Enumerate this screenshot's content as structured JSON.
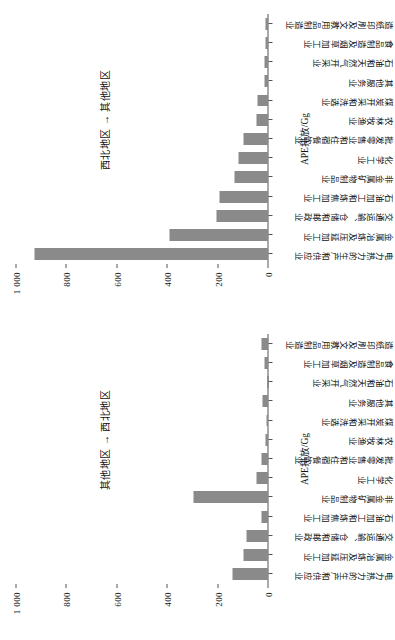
{
  "chart_data": [
    {
      "type": "bar",
      "panel_id": "right-panel",
      "title": "其他地区 → 西北地区",
      "xlabel": "",
      "ylabel": "APE排放/Gg",
      "ylim": [
        0,
        1000
      ],
      "yticks": [
        0,
        200,
        400,
        600,
        800,
        1000
      ],
      "ytick_labels": [
        "0",
        "200",
        "400",
        "600",
        "800",
        "1 000"
      ],
      "grid": false,
      "legend": "none",
      "orientation": "vertical-bars",
      "bar_color": "#8a8a8a",
      "categories": [
        "电力热力的生产和供应业",
        "金属冶炼及压延加工业",
        "交通运输、仓储和邮政业",
        "石油加工和炼焦加工业",
        "非金属矿物制品业",
        "化学工业",
        "批发零售业和住宿餐饮业",
        "农林牧渔业",
        "煤炭开采和洗选业",
        "其他服务业",
        "石油和天然气开采业",
        "食品制造及烟草加工业",
        "造纸印刷及文教用品制造业",
        "其他行业"
      ],
      "values": [
        140,
        95,
        85,
        22,
        295,
        45,
        22,
        7,
        3,
        20,
        1,
        14,
        25
      ]
    },
    {
      "type": "bar",
      "panel_id": "left-panel",
      "title": "西北地区 → 其他地区",
      "xlabel": "",
      "ylabel": "APE排放/Gg",
      "ylim": [
        0,
        1000
      ],
      "yticks": [
        0,
        200,
        400,
        600,
        800,
        1000
      ],
      "ytick_labels": [
        "0",
        "200",
        "400",
        "600",
        "800",
        "1 000"
      ],
      "grid": false,
      "legend": "none",
      "orientation": "vertical-bars",
      "bar_color": "#8a8a8a",
      "values": [
        930,
        390,
        205,
        190,
        130,
        115,
        95,
        42,
        40,
        14,
        12,
        9,
        7
      ]
    }
  ],
  "figure": {
    "categories": [
      "电力热力的生产和供应业",
      "金属冶炼及压延加工业",
      "交通运输、仓储和邮政业",
      "石油加工和炼焦加工业",
      "非金属矿物制品业",
      "化学工业",
      "批发零售业和住宿餐饮业",
      "农林牧渔业",
      "煤炭开采和洗选业",
      "其他服务业",
      "石油和天然气开采业",
      "食品制造及烟草加工业",
      "造纸印刷及文教用品制造业",
      "其他行业"
    ],
    "axis_title": "APE排放/Gg",
    "tick_labels": [
      "0",
      "200",
      "400",
      "600",
      "800",
      "1 000"
    ],
    "annotation_right": "其他地区 → 西北地区",
    "annotation_left": "西北地区 → 其他地区",
    "bar_color": "#8a8a8a",
    "axis_color": "#555555"
  }
}
